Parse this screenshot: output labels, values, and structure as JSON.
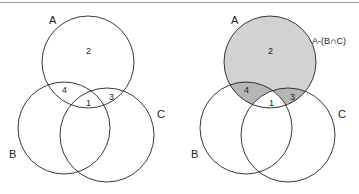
{
  "colors": {
    "stroke": "#222222",
    "shade_a_only": "#d4d4d4",
    "shade_overlap": "#b4b4b4",
    "background": "#ffffff"
  },
  "left_diagram": {
    "sets": {
      "a": "A",
      "b": "B",
      "c": "C"
    },
    "regions": {
      "r1": "1",
      "r2": "2",
      "r3": "3",
      "r4": "4"
    }
  },
  "right_diagram": {
    "sets": {
      "a": "A",
      "b": "B",
      "c": "C"
    },
    "regions": {
      "r1": "1",
      "r2": "2",
      "r3": "3",
      "r4": "4"
    },
    "shaded_label": "A-(B∩C)",
    "shaded_regions": [
      "2",
      "3",
      "4"
    ]
  }
}
